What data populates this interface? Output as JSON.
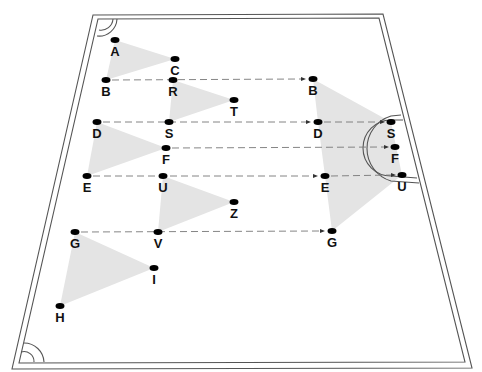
{
  "diagram": {
    "type": "sports-drill-field",
    "colors": {
      "background": "#ffffff",
      "line": "#555555",
      "dot": "#000000",
      "zone": "#e4e4e4",
      "label": "#111111",
      "pass_line": "#777777"
    },
    "field": {
      "outer": [
        [
          93,
          15
        ],
        [
          383,
          14
        ],
        [
          472,
          368
        ],
        [
          12,
          369
        ]
      ],
      "inner": [
        [
          98,
          19
        ],
        [
          379,
          18
        ],
        [
          465,
          362
        ],
        [
          19,
          363
        ]
      ]
    },
    "players": [
      {
        "id": "A",
        "label": "A",
        "x": 115,
        "y": 40
      },
      {
        "id": "C",
        "label": "C",
        "x": 175,
        "y": 59
      },
      {
        "id": "B",
        "label": "B",
        "x": 106,
        "y": 80
      },
      {
        "id": "R",
        "label": "R",
        "x": 173,
        "y": 80
      },
      {
        "id": "T",
        "label": "T",
        "x": 234,
        "y": 100
      },
      {
        "id": "B2",
        "label": "B",
        "x": 313,
        "y": 79
      },
      {
        "id": "D",
        "label": "D",
        "x": 97,
        "y": 122
      },
      {
        "id": "S",
        "label": "S",
        "x": 169,
        "y": 122
      },
      {
        "id": "D2",
        "label": "D",
        "x": 318,
        "y": 122
      },
      {
        "id": "S2",
        "label": "S",
        "x": 391,
        "y": 122
      },
      {
        "id": "F",
        "label": "F",
        "x": 166,
        "y": 148
      },
      {
        "id": "F2",
        "label": "F",
        "x": 395,
        "y": 147
      },
      {
        "id": "E",
        "label": "E",
        "x": 87,
        "y": 176
      },
      {
        "id": "U",
        "label": "U",
        "x": 163,
        "y": 176
      },
      {
        "id": "E2",
        "label": "E",
        "x": 325,
        "y": 176
      },
      {
        "id": "U2",
        "label": "U",
        "x": 402,
        "y": 175
      },
      {
        "id": "Z",
        "label": "Z",
        "x": 234,
        "y": 202
      },
      {
        "id": "G",
        "label": "G",
        "x": 75,
        "y": 232
      },
      {
        "id": "V",
        "label": "V",
        "x": 158,
        "y": 232
      },
      {
        "id": "G2",
        "label": "G",
        "x": 332,
        "y": 231
      },
      {
        "id": "I",
        "label": "I",
        "x": 154,
        "y": 268
      },
      {
        "id": "H",
        "label": "H",
        "x": 60,
        "y": 306
      }
    ],
    "zones": [
      {
        "name": "zone-abc",
        "points": [
          [
            115,
            40
          ],
          [
            175,
            59
          ],
          [
            106,
            80
          ]
        ]
      },
      {
        "name": "zone-rts",
        "points": [
          [
            173,
            80
          ],
          [
            234,
            100
          ],
          [
            169,
            122
          ]
        ]
      },
      {
        "name": "zone-dfe",
        "points": [
          [
            97,
            122
          ],
          [
            166,
            148
          ],
          [
            87,
            176
          ]
        ]
      },
      {
        "name": "zone-uzv",
        "points": [
          [
            163,
            176
          ],
          [
            234,
            202
          ],
          [
            158,
            232
          ]
        ]
      },
      {
        "name": "zone-gih",
        "points": [
          [
            75,
            232
          ],
          [
            154,
            268
          ],
          [
            60,
            306
          ]
        ]
      },
      {
        "name": "zone-big",
        "points": [
          [
            313,
            79
          ],
          [
            391,
            122
          ],
          [
            402,
            175
          ],
          [
            332,
            231
          ],
          [
            325,
            176
          ],
          [
            318,
            122
          ]
        ]
      }
    ],
    "passes": [
      {
        "from": "B",
        "to": "B2",
        "x1": 112,
        "y1": 80,
        "x2": 306,
        "y2": 79,
        "arrow": true
      },
      {
        "from": "D",
        "to": "D2",
        "x1": 103,
        "y1": 122,
        "x2": 311,
        "y2": 122,
        "arrow": true
      },
      {
        "from": "D2",
        "to": "S2",
        "x1": 324,
        "y1": 122,
        "x2": 385,
        "y2": 122,
        "arrow": true
      },
      {
        "from": "F",
        "to": "F2",
        "x1": 172,
        "y1": 148,
        "x2": 389,
        "y2": 147,
        "arrow": true
      },
      {
        "from": "E",
        "to": "E2",
        "x1": 93,
        "y1": 176,
        "x2": 318,
        "y2": 176,
        "arrow": true
      },
      {
        "from": "E2",
        "to": "U2",
        "x1": 331,
        "y1": 176,
        "x2": 396,
        "y2": 175,
        "arrow": true
      },
      {
        "from": "G",
        "to": "G2",
        "x1": 81,
        "y1": 232,
        "x2": 325,
        "y2": 231,
        "arrow": true
      }
    ]
  }
}
